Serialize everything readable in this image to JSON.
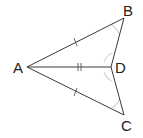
{
  "diagram": {
    "type": "geometry-figure",
    "points": {
      "A": {
        "label": "A"
      },
      "B": {
        "label": "B"
      },
      "C": {
        "label": "C"
      },
      "D": {
        "label": "D"
      }
    },
    "segments": [
      "AB",
      "AC",
      "AD",
      "BD",
      "DC"
    ],
    "congruence_marks": [
      {
        "segment": "AB",
        "marks": 1
      },
      {
        "segment": "AC",
        "marks": 1
      },
      {
        "segment": "AD",
        "marks": 2
      }
    ],
    "angle_marks": [
      "ABD",
      "ADB",
      "ADC",
      "ACD"
    ],
    "colors": {
      "line": "#3a3a3a",
      "angle_mark": "#d6d6d6",
      "text": "#222222"
    }
  }
}
